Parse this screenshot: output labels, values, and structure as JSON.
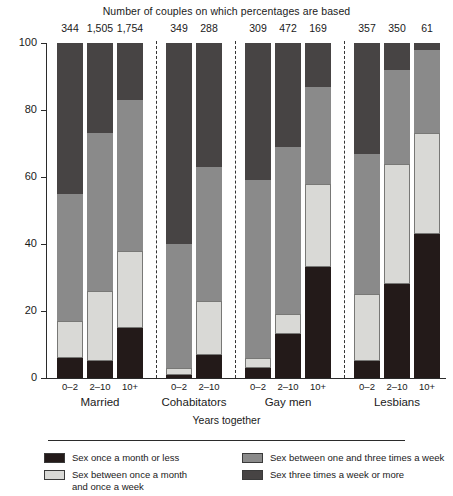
{
  "chart": {
    "top_title": "Number of couples on which percentages are based",
    "xaxis_title": "Years together",
    "yticks": [
      "0",
      "20",
      "40",
      "60",
      "80",
      "100"
    ]
  },
  "legend": {
    "items": [
      {
        "label": "Sex once a month or less",
        "key": "once_month_or_less",
        "color": "#231a19"
      },
      {
        "label": "Sex between once a month and once a week",
        "label_line1": "Sex between once a month",
        "label_line2": "and once a week",
        "key": "month_to_week",
        "color": "#d9d9d6"
      },
      {
        "label": "Sex between one and three times a week",
        "key": "one_to_three_week",
        "color": "#8a8a8a"
      },
      {
        "label": "Sex three times a week or more",
        "key": "three_or_more_week",
        "color": "#474444"
      }
    ]
  },
  "groups": [
    {
      "name": "Married",
      "bars": [
        "0–2",
        "2–10",
        "10+"
      ]
    },
    {
      "name": "Cohabitators",
      "bars": [
        "0–2",
        "2–10"
      ]
    },
    {
      "name": "Gay men",
      "bars": [
        "0–2",
        "2–10",
        "10+"
      ]
    },
    {
      "name": "Lesbians",
      "bars": [
        "0–2",
        "2–10",
        "10+"
      ]
    }
  ],
  "chart_data": {
    "type": "bar",
    "subtype": "stacked-100-percent",
    "title": "Number of couples on which percentages are based",
    "xlabel": "Years together",
    "ylabel": "",
    "ylim": [
      0,
      100
    ],
    "yticks": [
      0,
      20,
      40,
      60,
      80,
      100
    ],
    "grid": false,
    "legend_position": "bottom",
    "categories": [
      "Married 0–2",
      "Married 2–10",
      "Married 10+",
      "Cohabitators 0–2",
      "Cohabitators 2–10",
      "Gay men 0–2",
      "Gay men 2–10",
      "Gay men 10+",
      "Lesbians 0–2",
      "Lesbians 2–10",
      "Lesbians 10+"
    ],
    "group_labels": [
      "Married",
      "Cohabitators",
      "Gay men",
      "Lesbians"
    ],
    "duration_labels": [
      "0–2",
      "2–10",
      "10+"
    ],
    "n_labels": [
      "344",
      "1,505",
      "1,754",
      "349",
      "288",
      "309",
      "472",
      "169",
      "357",
      "350",
      "61"
    ],
    "series": [
      {
        "name": "Sex once a month or less",
        "values": [
          6,
          5,
          15,
          1,
          7,
          3,
          13,
          33,
          5,
          28,
          43
        ]
      },
      {
        "name": "Sex between once a month and once a week",
        "values": [
          11,
          21,
          23,
          2,
          16,
          3,
          6,
          25,
          20,
          36,
          30
        ]
      },
      {
        "name": "Sex between one and three times a week",
        "values": [
          38,
          47,
          45,
          37,
          40,
          53,
          50,
          29,
          42,
          28,
          25
        ]
      },
      {
        "name": "Sex three times a week or more",
        "values": [
          45,
          27,
          17,
          60,
          37,
          41,
          31,
          13,
          33,
          8,
          2
        ]
      }
    ]
  }
}
